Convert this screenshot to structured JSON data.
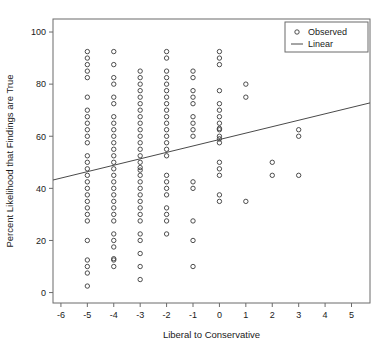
{
  "chart_data": {
    "type": "scatter",
    "title": "",
    "xlabel": "Liberal to Conservative",
    "ylabel": "Percent Likelihood that Findings are True",
    "xlim": [
      -6.3,
      5.7
    ],
    "ylim": [
      -4,
      105
    ],
    "xticks": [
      -6,
      -5,
      -4,
      -3,
      -2,
      -1,
      0,
      1,
      2,
      3,
      4,
      5
    ],
    "xticklabels": [
      "-6",
      "-5",
      "-4",
      "-3",
      "-2",
      "-1",
      "0",
      "1",
      "2",
      "3",
      "4",
      "5"
    ],
    "yticks": [
      0,
      20,
      40,
      60,
      80,
      100
    ],
    "yticklabels": [
      "0",
      "20",
      "40",
      "60",
      "80",
      "100"
    ],
    "grid": false,
    "legend": {
      "position": "top-right",
      "entries": [
        {
          "label": "Observed",
          "marker": "circle"
        },
        {
          "label": "Linear",
          "marker": "line"
        }
      ]
    },
    "series": [
      {
        "name": "Observed",
        "marker": "open-circle",
        "color": "#3a3a3a",
        "points": [
          [
            -5,
            92.5
          ],
          [
            -5,
            90
          ],
          [
            -5,
            87.5
          ],
          [
            -5,
            85
          ],
          [
            -5,
            82.5
          ],
          [
            -5,
            75
          ],
          [
            -5,
            70
          ],
          [
            -5,
            67.5
          ],
          [
            -5,
            65
          ],
          [
            -5,
            62.5
          ],
          [
            -5,
            60
          ],
          [
            -5,
            57.5
          ],
          [
            -5,
            52.5
          ],
          [
            -5,
            50
          ],
          [
            -5,
            47.5
          ],
          [
            -5,
            45
          ],
          [
            -5,
            42.5
          ],
          [
            -5,
            40
          ],
          [
            -5,
            37.5
          ],
          [
            -5,
            35
          ],
          [
            -5,
            32.5
          ],
          [
            -5,
            30
          ],
          [
            -5,
            27.5
          ],
          [
            -5,
            20
          ],
          [
            -5,
            12.5
          ],
          [
            -5,
            10
          ],
          [
            -5,
            7.5
          ],
          [
            -5,
            2.5
          ],
          [
            -4,
            92.5
          ],
          [
            -4,
            87.5
          ],
          [
            -4,
            82.5
          ],
          [
            -4,
            80
          ],
          [
            -4,
            75
          ],
          [
            -4,
            72.5
          ],
          [
            -4,
            67.5
          ],
          [
            -4,
            65
          ],
          [
            -4,
            62.5
          ],
          [
            -4,
            60
          ],
          [
            -4,
            57.5
          ],
          [
            -4,
            55
          ],
          [
            -4,
            52.5
          ],
          [
            -4,
            50
          ],
          [
            -4,
            47.5
          ],
          [
            -4,
            45
          ],
          [
            -4,
            42.5
          ],
          [
            -4,
            40
          ],
          [
            -4,
            37.5
          ],
          [
            -4,
            35
          ],
          [
            -4,
            32.5
          ],
          [
            -4,
            30
          ],
          [
            -4,
            27.5
          ],
          [
            -4,
            22.5
          ],
          [
            -4,
            20
          ],
          [
            -4,
            17.5
          ],
          [
            -4,
            13
          ],
          [
            -4,
            12.5
          ],
          [
            -4,
            10
          ],
          [
            -3,
            85
          ],
          [
            -3,
            82.5
          ],
          [
            -3,
            80
          ],
          [
            -3,
            77.5
          ],
          [
            -3,
            75
          ],
          [
            -3,
            72.5
          ],
          [
            -3,
            70
          ],
          [
            -3,
            67.5
          ],
          [
            -3,
            65
          ],
          [
            -3,
            62.5
          ],
          [
            -3,
            60
          ],
          [
            -3,
            57.5
          ],
          [
            -3,
            55
          ],
          [
            -3,
            52.5
          ],
          [
            -3,
            50
          ],
          [
            -3,
            48
          ],
          [
            -3,
            47
          ],
          [
            -3,
            45
          ],
          [
            -3,
            42.5
          ],
          [
            -3,
            40
          ],
          [
            -3,
            37.5
          ],
          [
            -3,
            35
          ],
          [
            -3,
            32.5
          ],
          [
            -3,
            30
          ],
          [
            -3,
            27.5
          ],
          [
            -3,
            22.5
          ],
          [
            -3,
            20
          ],
          [
            -3,
            15
          ],
          [
            -3,
            10
          ],
          [
            -3,
            5
          ],
          [
            -2,
            92.5
          ],
          [
            -2,
            90
          ],
          [
            -2,
            85
          ],
          [
            -2,
            82.5
          ],
          [
            -2,
            80
          ],
          [
            -2,
            77.5
          ],
          [
            -2,
            75
          ],
          [
            -2,
            72.5
          ],
          [
            -2,
            70
          ],
          [
            -2,
            67.5
          ],
          [
            -2,
            65
          ],
          [
            -2,
            62.5
          ],
          [
            -2,
            60
          ],
          [
            -2,
            57.5
          ],
          [
            -2,
            55
          ],
          [
            -2,
            52.5
          ],
          [
            -2,
            45
          ],
          [
            -2,
            42.5
          ],
          [
            -2,
            40
          ],
          [
            -2,
            37.5
          ],
          [
            -2,
            32.5
          ],
          [
            -2,
            30
          ],
          [
            -2,
            27.5
          ],
          [
            -2,
            22.5
          ],
          [
            -1,
            85
          ],
          [
            -1,
            82.5
          ],
          [
            -1,
            77.5
          ],
          [
            -1,
            75
          ],
          [
            -1,
            72.5
          ],
          [
            -1,
            67.5
          ],
          [
            -1,
            65
          ],
          [
            -1,
            62.5
          ],
          [
            -1,
            60
          ],
          [
            -1,
            42.5
          ],
          [
            -1,
            40
          ],
          [
            -1,
            27.5
          ],
          [
            -1,
            20
          ],
          [
            -1,
            10
          ],
          [
            0,
            92.5
          ],
          [
            0,
            90
          ],
          [
            0,
            87.5
          ],
          [
            0,
            77.5
          ],
          [
            0,
            72.5
          ],
          [
            0,
            70
          ],
          [
            0,
            67.5
          ],
          [
            0,
            65
          ],
          [
            0,
            63
          ],
          [
            0,
            62.5
          ],
          [
            0,
            60
          ],
          [
            0,
            59
          ],
          [
            0,
            57.5
          ],
          [
            0,
            50
          ],
          [
            0,
            47.5
          ],
          [
            0,
            45
          ],
          [
            0,
            37.5
          ],
          [
            0,
            35
          ],
          [
            1,
            80
          ],
          [
            1,
            75
          ],
          [
            1,
            35
          ],
          [
            2,
            50
          ],
          [
            2,
            45
          ],
          [
            3,
            62.5
          ],
          [
            3,
            60
          ],
          [
            3,
            45
          ]
        ]
      }
    ],
    "fit_line": {
      "name": "Linear",
      "color": "#4a4a4a",
      "x_start": -6.3,
      "y_start": 43.2,
      "x_end": 5.7,
      "y_end": 72.8
    }
  }
}
